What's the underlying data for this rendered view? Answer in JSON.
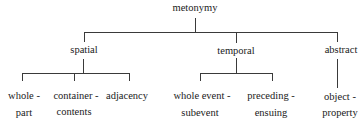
{
  "diagram": {
    "type": "tree",
    "root": {
      "label": "metonymy",
      "children": [
        {
          "label": "spatial",
          "children": [
            {
              "line1": "whole -",
              "line2": "part"
            },
            {
              "line1": "container -",
              "line2": "contents"
            },
            {
              "line1": "adjacency",
              "line2": ""
            }
          ]
        },
        {
          "label": "temporal",
          "children": [
            {
              "line1": "whole event -",
              "line2": "subevent"
            },
            {
              "line1": "preceding -",
              "line2": "ensuing"
            }
          ]
        },
        {
          "label": "abstract",
          "children": [
            {
              "line1": "object -",
              "line2": "property"
            }
          ]
        }
      ]
    },
    "colors": {
      "line": "#3a3a3a",
      "text": "#1a1a1a",
      "background": "#ffffff"
    }
  }
}
